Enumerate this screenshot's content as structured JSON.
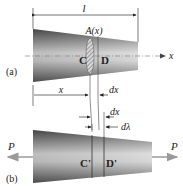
{
  "figure": {
    "part_a": {
      "label": "(a)",
      "length_label": "l",
      "area_label": "A(x)",
      "section_left_label": "C",
      "section_right_label": "D",
      "axis_label": "x",
      "position_label": "x",
      "element_label": "dx"
    },
    "part_b": {
      "label": "(b)",
      "element_label": "dx",
      "elongation_label": "dλ",
      "section_left_label": "C'",
      "section_right_label": "D'",
      "load_left_label": "P",
      "load_right_label": "P"
    },
    "colors": {
      "bar_dark": "#5a5a5a",
      "bar_light": "#e0e0e0",
      "line": "#333333",
      "arrow_gray": "#9a9a9a",
      "hatch": "#777777"
    }
  }
}
